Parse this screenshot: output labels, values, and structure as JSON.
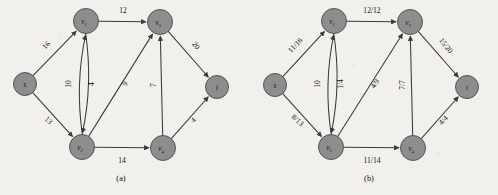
{
  "figure": {
    "background_color": "#f2f0ec",
    "node_fill": "#8d8d8d",
    "node_stroke": "#4a4a4a",
    "edge_color": "#3a3a3a",
    "text_color": "#141414"
  },
  "panels": [
    {
      "id": "a",
      "caption": "(a)",
      "caption_x": 121,
      "caption_y": 181,
      "origin_x": 0,
      "nodes": [
        {
          "id": "s",
          "label": "s",
          "sub": "",
          "x": 25,
          "y": 84,
          "r": 11.5
        },
        {
          "id": "v1",
          "label": "v",
          "sub": "1",
          "x": 86,
          "y": 21,
          "r": 12.5
        },
        {
          "id": "v2",
          "label": "v",
          "sub": "2",
          "x": 82,
          "y": 147,
          "r": 12.5
        },
        {
          "id": "v3",
          "label": "v",
          "sub": "3",
          "x": 160,
          "y": 22,
          "r": 12.5
        },
        {
          "id": "v4",
          "label": "v",
          "sub": "4",
          "x": 163,
          "y": 148,
          "r": 12.5
        },
        {
          "id": "t",
          "label": "t",
          "sub": "",
          "x": 217,
          "y": 87,
          "r": 11.5
        }
      ],
      "edges": [
        {
          "from": "s",
          "to": "v1",
          "label": "16",
          "lx": 48,
          "ly": 47,
          "rot": -46,
          "curve": 0
        },
        {
          "from": "s",
          "to": "v2",
          "label": "13",
          "lx": 47,
          "ly": 122,
          "rot": 42,
          "curve": 0
        },
        {
          "from": "v1",
          "to": "v3",
          "label": "12",
          "lx": 123,
          "ly": 13,
          "rot": 0,
          "curve": 0
        },
        {
          "from": "v1",
          "to": "v2",
          "label": "10",
          "lx": 71,
          "ly": 84,
          "rot": -90,
          "curve": -9
        },
        {
          "from": "v2",
          "to": "v1",
          "label": "4",
          "lx": 94,
          "ly": 84,
          "rot": -90,
          "curve": -9
        },
        {
          "from": "v2",
          "to": "v3",
          "label": "9",
          "lx": 127,
          "ly": 85,
          "rot": -56,
          "curve": 0
        },
        {
          "from": "v4",
          "to": "v3",
          "label": "7",
          "lx": 156,
          "ly": 85,
          "rot": -90,
          "curve": 0
        },
        {
          "from": "v3",
          "to": "t",
          "label": "20",
          "lx": 194,
          "ly": 47,
          "rot": 52,
          "curve": 0
        },
        {
          "from": "v4",
          "to": "t",
          "label": "4",
          "lx": 195,
          "ly": 122,
          "rot": -44,
          "curve": 0
        },
        {
          "from": "v2",
          "to": "v4",
          "label": "14",
          "lx": 122,
          "ly": 163,
          "rot": 0,
          "curve": 0
        }
      ]
    },
    {
      "id": "b",
      "caption": "(b)",
      "caption_x": 369,
      "caption_y": 181,
      "origin_x": 250,
      "nodes": [
        {
          "id": "s",
          "label": "s",
          "sub": "",
          "x": 275,
          "y": 85,
          "r": 11.5
        },
        {
          "id": "v1",
          "label": "v",
          "sub": "1",
          "x": 334,
          "y": 21,
          "r": 12.5
        },
        {
          "id": "v2",
          "label": "v",
          "sub": "2",
          "x": 331,
          "y": 147,
          "r": 12.5
        },
        {
          "id": "v3",
          "label": "v",
          "sub": "3",
          "x": 410,
          "y": 22,
          "r": 12.5
        },
        {
          "id": "v4",
          "label": "v",
          "sub": "4",
          "x": 413,
          "y": 148,
          "r": 12.5
        },
        {
          "id": "t",
          "label": "t",
          "sub": "",
          "x": 467,
          "y": 87,
          "r": 11.5
        }
      ],
      "edges": [
        {
          "from": "s",
          "to": "v1",
          "label": "11/16",
          "lx": 297,
          "ly": 47,
          "rot": -46,
          "curve": 0
        },
        {
          "from": "s",
          "to": "v2",
          "label": "8/13",
          "lx": 296,
          "ly": 122,
          "rot": 42,
          "curve": 0
        },
        {
          "from": "v1",
          "to": "v3",
          "label": "12/12",
          "lx": 372,
          "ly": 13,
          "rot": 0,
          "curve": 0
        },
        {
          "from": "v1",
          "to": "v2",
          "label": "10",
          "lx": 320,
          "ly": 84,
          "rot": -90,
          "curve": -9
        },
        {
          "from": "v2",
          "to": "v1",
          "label": "1/4",
          "lx": 343,
          "ly": 84,
          "rot": -90,
          "curve": -9
        },
        {
          "from": "v2",
          "to": "v3",
          "label": "4/9",
          "lx": 377,
          "ly": 85,
          "rot": -56,
          "curve": 0
        },
        {
          "from": "v4",
          "to": "v3",
          "label": "7/7",
          "lx": 405,
          "ly": 85,
          "rot": -90,
          "curve": 0
        },
        {
          "from": "v3",
          "to": "t",
          "label": "15/20",
          "lx": 444,
          "ly": 47,
          "rot": 52,
          "curve": 0
        },
        {
          "from": "v4",
          "to": "t",
          "label": "4/4",
          "lx": 445,
          "ly": 122,
          "rot": -44,
          "curve": 0
        },
        {
          "from": "v2",
          "to": "v4",
          "label": "11/14",
          "lx": 372,
          "ly": 163,
          "rot": 0,
          "curve": 0
        }
      ]
    }
  ]
}
